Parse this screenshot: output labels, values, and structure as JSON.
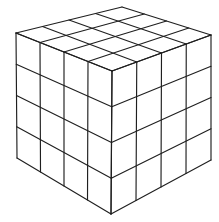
{
  "figure": {
    "name": "subdivided-cube-wireframe",
    "background_color": "#ffffff",
    "stroke_color": "#1f1f1f",
    "stroke_width": 1.15,
    "divisions": 4,
    "canvas": {
      "width": 219,
      "height": 222
    },
    "corners": {
      "left_top": [
        16,
        33
      ],
      "back_top": [
        122,
        7
      ],
      "right_top": [
        211,
        35
      ],
      "front_top": [
        112,
        71
      ],
      "left_bottom": [
        17,
        158
      ],
      "front_bottom": [
        111,
        214
      ],
      "right_bottom": [
        211,
        160
      ]
    },
    "faces": [
      {
        "name": "top-face",
        "p00": "left_top",
        "p10": "back_top",
        "p01": "front_top",
        "p11": "right_top"
      },
      {
        "name": "left-face",
        "p00": "left_top",
        "p10": "front_top",
        "p01": "left_bottom",
        "p11": "front_bottom"
      },
      {
        "name": "right-face",
        "p00": "front_top",
        "p10": "right_top",
        "p01": "front_bottom",
        "p11": "right_bottom"
      }
    ]
  }
}
